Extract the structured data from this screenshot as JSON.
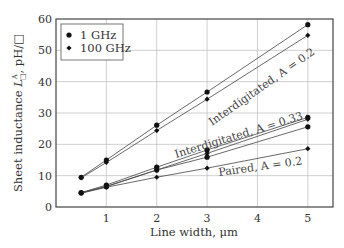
{
  "chart_data": {
    "type": "line",
    "title": "",
    "xlabel": "Line width, μm",
    "ylabel": "Sheet inductance L□^A, pH/□",
    "xlim": [
      0,
      5.5
    ],
    "ylim": [
      0,
      60
    ],
    "x_ticks": [
      1,
      2,
      3,
      4,
      5
    ],
    "y_ticks": [
      0,
      10,
      20,
      30,
      40,
      50,
      60
    ],
    "grid": true,
    "legend_position": "upper left",
    "legend": [
      {
        "label": "1 GHz",
        "marker": "circle"
      },
      {
        "label": "100 GHz",
        "marker": "diamond"
      }
    ],
    "x": [
      0.5,
      1,
      2,
      3,
      5
    ],
    "series": [
      {
        "name": "Interdigitated, A = 0.2 (1 GHz)",
        "marker": "circle",
        "values": [
          9.5,
          15.0,
          26.1,
          36.7,
          58.2
        ]
      },
      {
        "name": "Interdigitated, A = 0.2 (100 GHz)",
        "marker": "diamond",
        "values": [
          9.3,
          14.2,
          24.4,
          34.4,
          54.8
        ]
      },
      {
        "name": "Interdigitated, A = 0.33 (1 GHz)",
        "marker": "circle",
        "values": [
          4.6,
          7.0,
          12.7,
          18.2,
          28.6
        ]
      },
      {
        "name": "Interdigitated, A = 0.33 (100 GHz)",
        "marker": "diamond",
        "values": [
          4.5,
          6.6,
          11.8,
          17.1,
          28.0
        ]
      },
      {
        "name": "Paired, A = 0.2 (1 GHz)",
        "marker": "circle",
        "values": [
          4.5,
          6.5,
          11.8,
          15.9,
          25.6
        ]
      },
      {
        "name": "Paired, A = 0.2 (100 GHz)",
        "marker": "diamond",
        "values": [
          4.4,
          6.3,
          9.5,
          12.4,
          18.6
        ]
      }
    ],
    "annotations": [
      {
        "text": "Interdigitated, A = 0.2",
        "x": 3.3,
        "y": 40
      },
      {
        "text": "Interdigitated, A = 0.33",
        "x": 3.3,
        "y": 22
      },
      {
        "text": "Paired, A = 0.2",
        "x": 4.0,
        "y": 15
      }
    ]
  },
  "labels": {
    "xlabel": "Line width, μm",
    "ylabel_main": "Sheet inductance ",
    "ylabel_sym": "L",
    "ylabel_sup": "A",
    "ylabel_sub": "□",
    "ylabel_tail": ", pH/□",
    "legend_1": "1 GHz",
    "legend_2": "100 GHz",
    "ann_1": "Interdigitated, A = 0.2",
    "ann_2": "Interdigitated, A = 0.33",
    "ann_3": "Paired, A = 0.2"
  }
}
